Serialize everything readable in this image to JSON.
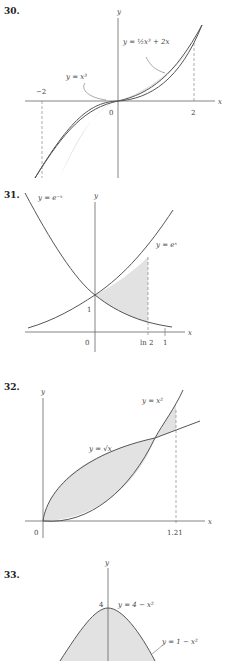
{
  "figures": [
    {
      "number": "30.",
      "axis_x": "x",
      "axis_y": "y",
      "curves": [
        "y = x³",
        "y = ½x³ + 2x"
      ],
      "ticks": [
        "−2",
        "0",
        "2"
      ]
    },
    {
      "number": "31.",
      "axis_x": "x",
      "axis_y": "y",
      "curves": [
        "y = e⁻ˣ",
        "y = eˣ"
      ],
      "ticks": [
        "0",
        "1",
        "ln 2",
        "1"
      ]
    },
    {
      "number": "32.",
      "axis_x": "x",
      "axis_y": "y",
      "curves": [
        "y = x²",
        "y = √x"
      ],
      "ticks": [
        "0",
        "1.21"
      ]
    },
    {
      "number": "33.",
      "axis_y": "y",
      "curves": [
        "y = 4 − x²",
        "y = 1 − x²"
      ],
      "ticks": [
        "4"
      ]
    }
  ],
  "colors": {
    "shade": "#e2e2e2",
    "curve": "#555555",
    "axis": "#666666"
  }
}
